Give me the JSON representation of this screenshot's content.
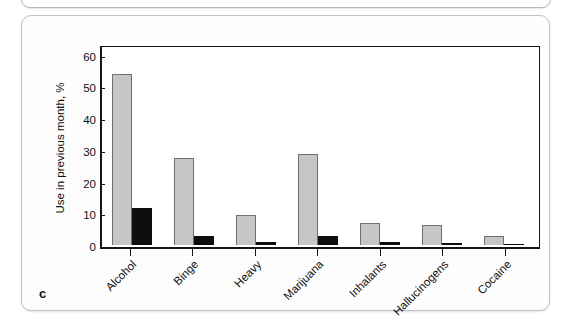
{
  "panel": {
    "letter": "c"
  },
  "chart_data": {
    "type": "bar",
    "title": "",
    "xlabel": "",
    "ylabel": "Use in previous month, %",
    "ylim": [
      0,
      63
    ],
    "yticks": [
      0,
      10,
      20,
      30,
      40,
      50,
      60
    ],
    "ytick_labels": [
      "0",
      "10",
      "20",
      "30",
      "40",
      "50",
      "60"
    ],
    "grid": false,
    "legend": "none",
    "categories": [
      "Alcohol",
      "Binge",
      "Heavy",
      "Marijuana",
      "Inhalants",
      "Hallucinogens",
      "Cocaine"
    ],
    "series": [
      {
        "name": "series-1",
        "color": "#c6c6c6",
        "values": [
          53.9,
          27.4,
          9.3,
          28.8,
          7.0,
          6.3,
          2.8
        ]
      },
      {
        "name": "series-2",
        "color": "#0d0d0d",
        "values": [
          11.6,
          2.9,
          0.8,
          2.7,
          0.8,
          0.5,
          0.4
        ]
      }
    ]
  },
  "colors": {
    "series_1": "#c6c6c6",
    "series_2": "#0d0d0d",
    "axis": "#151515",
    "panel_border": "#c2c2c2"
  }
}
